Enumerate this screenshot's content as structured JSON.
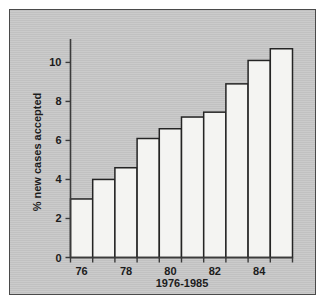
{
  "figure": {
    "background_color": "#c8c8c8",
    "frame_color": "#4a4a4a",
    "bar_fill_color": "#f4f4f2",
    "bar_edge_color": "#242424"
  },
  "chart_data": {
    "type": "bar",
    "title": "",
    "subtitle": "",
    "xlabel": "1976-1985",
    "ylabel": "% new cases accepted",
    "categories": [
      "1976",
      "1977",
      "1978",
      "1979",
      "1980",
      "1981",
      "1982",
      "1983",
      "1984",
      "1985"
    ],
    "values": [
      3.0,
      4.0,
      4.6,
      6.1,
      6.6,
      7.2,
      7.45,
      8.9,
      10.1,
      10.7
    ],
    "xtick_labels": [
      "76",
      "78",
      "80",
      "82",
      "84"
    ],
    "xtick_categories": [
      "1976",
      "1978",
      "1980",
      "1982",
      "1984"
    ],
    "ytick_labels": [
      "0",
      "2",
      "4",
      "6",
      "8",
      "10"
    ],
    "ytick_values": [
      0,
      2,
      4,
      6,
      8,
      10
    ],
    "ylim": [
      0,
      11.2
    ],
    "xlim": [
      0,
      10
    ],
    "grid": false,
    "legend": null,
    "legend_position": "none",
    "bar_gap": 0
  }
}
